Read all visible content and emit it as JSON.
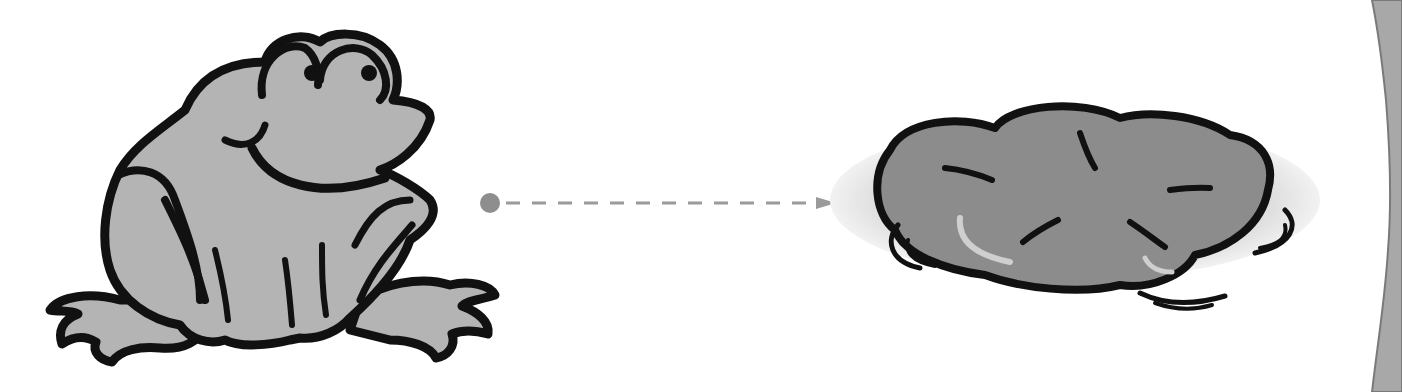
{
  "scene": {
    "description": "Cartoon frog jumping toward a lily pad, indicated by a dashed arrow",
    "elements": [
      {
        "id": "frog",
        "icon": "frog-icon",
        "fill": "#b4b4b4",
        "stroke": "#111111"
      },
      {
        "id": "arrow",
        "icon": "dashed-arrow-icon",
        "color": "#9a9a9a",
        "start_dot_color": "#8e8e8e"
      },
      {
        "id": "lily-pad",
        "icon": "lily-pad-icon",
        "fill": "#8c8c8c",
        "stroke": "#111111",
        "water_color": "#d0d0d0"
      },
      {
        "id": "stone-edge",
        "icon": "stone-texture-icon",
        "fill": "#a8a8a8"
      }
    ]
  },
  "colors": {
    "background": "#ffffff",
    "frog_body": "#b4b4b4",
    "outline": "#111111",
    "arrow": "#9a9a9a",
    "lily_pad": "#8c8c8c",
    "water": "#d6d6d6",
    "stone": "#a8a8a8"
  }
}
